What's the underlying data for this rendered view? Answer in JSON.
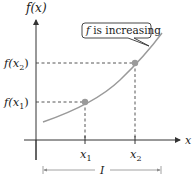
{
  "diagram": {
    "y_axis_label": "f(x)",
    "x_axis_label": "x",
    "callout": {
      "italic_part": "f",
      "text": " is increasing"
    },
    "points": [
      {
        "y_label_fn": "f(",
        "y_label_var": "x",
        "y_label_sub": "1",
        "y_label_close": ")",
        "x_label_var": "x",
        "x_label_sub": "1"
      },
      {
        "y_label_fn": "f(",
        "y_label_var": "x",
        "y_label_sub": "2",
        "y_label_close": ")",
        "x_label_var": "x",
        "x_label_sub": "2"
      }
    ],
    "interval_label": "I",
    "colors": {
      "curve": "#9a9a9a",
      "point": "#9a9a9a",
      "axis": "#333333",
      "dashed": "#444444",
      "text": "#1a1a1a",
      "interval": "#8a8a8a"
    }
  }
}
